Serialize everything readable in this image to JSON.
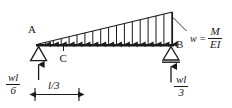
{
  "figure": {
    "kind": "beam-load-diagram",
    "background_color": "#ffffff",
    "ink_color": "#1a1a1a",
    "labels": {
      "point_a": "A",
      "point_b": "B",
      "point_c": "C"
    },
    "load_equation": {
      "lhs": "w =",
      "numerator": "M",
      "denominator": "EI"
    },
    "reaction_left": {
      "numerator": "wl",
      "denominator": "6"
    },
    "reaction_right": {
      "numerator": "wl",
      "denominator": "3"
    },
    "dimension": {
      "label": "l/3"
    },
    "load": {
      "shape": "triangular",
      "direction": "downward",
      "arrow_count": 17,
      "peak_side": "right"
    },
    "supports": {
      "left": "pin-triangle",
      "right": "roller-triangle-with-line"
    }
  }
}
